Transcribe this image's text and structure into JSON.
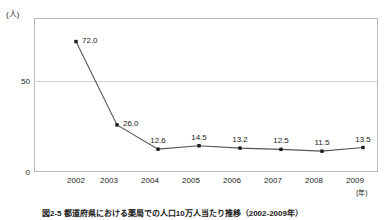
{
  "chart_data": {
    "type": "line",
    "title": "",
    "xlabel": "(年)",
    "ylabel": "(人)",
    "categories": [
      "2002",
      "2003",
      "2004",
      "2005",
      "2006",
      "2007",
      "2008",
      "2009"
    ],
    "values": [
      72.0,
      26.0,
      12.6,
      14.5,
      13.2,
      12.5,
      11.5,
      13.5
    ],
    "point_labels": [
      "72.0",
      "26.0",
      "12.6",
      "14.5",
      "13.2",
      "12.5",
      "11.5",
      "13.5"
    ],
    "series": [
      {
        "name": "",
        "values": [
          72.0,
          26.0,
          12.6,
          14.5,
          13.2,
          12.5,
          11.5,
          13.5
        ]
      }
    ],
    "ylim": [
      0,
      85
    ],
    "yticks": [
      "0",
      "50"
    ],
    "ytick_values": [
      0,
      50
    ],
    "grid": "horizontal-at-50",
    "legend": "none",
    "line_color": "#555555",
    "marker_color": "#1a1a1a",
    "marker_shape": "square",
    "frame_color": "#b9b9b9",
    "gridline_color": "#cfcfcf",
    "background": "#ffffff"
  },
  "axes": {
    "y_unit": "(人)",
    "x_unit": "(年)"
  },
  "caption": {
    "text": "図2-5 都道府県における薬局での人口10万人当たり推移（2002-2009年）"
  }
}
